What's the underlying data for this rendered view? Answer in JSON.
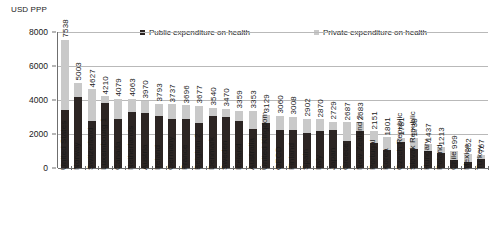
{
  "chart_data": {
    "type": "bar",
    "subtype": "stacked-column",
    "title": "",
    "xlabel": "",
    "ylabel": "USD PPP",
    "ylim": [
      0,
      8000
    ],
    "yticks": [
      0,
      2000,
      4000,
      6000,
      8000
    ],
    "grid": true,
    "legend_position": "top-center",
    "categories": [
      "United States",
      "Norway",
      "Switzerland",
      "Luxembourg 1",
      "Canada",
      "Netherlands",
      "Austria",
      "Ireland",
      "Germany",
      "France",
      "Belgium 2",
      "Denmark",
      "Sweden",
      "Iceland",
      "Australia",
      "United Kingdom",
      "OECD",
      "Finland",
      "Spain",
      "Italy",
      "Japan",
      "Greece",
      "New Zealand 2",
      "Portugal",
      "Korea",
      "Czech Republic",
      "Slovak Republic",
      "Hungary",
      "Poland",
      "Chile",
      "Mexico",
      "Turkey"
    ],
    "totals": [
      7538,
      5003,
      4627,
      4210,
      4079,
      4063,
      3970,
      3793,
      3737,
      3696,
      3677,
      3540,
      3470,
      3359,
      3353,
      3129,
      3060,
      3008,
      2902,
      2870,
      2729,
      2687,
      2683,
      2151,
      1801,
      1781,
      1738,
      1437,
      1213,
      999,
      852,
      767
    ],
    "series": [
      {
        "name": "Public expenditure on health",
        "color": "#2c2523",
        "values": [
          3426,
          4205,
          2750,
          3839,
          2885,
          3296,
          3209,
          3063,
          2876,
          2872,
          2659,
          3033,
          2994,
          2752,
          2278,
          2626,
          2256,
          2252,
          2043,
          2206,
          2230,
          1613,
          2177,
          1444,
          1060,
          1522,
          1142,
          1014,
          858,
          470,
          350,
          545
        ]
      },
      {
        "name": "Private expenditure on health",
        "color": "#c9c9c9",
        "values": [
          4112,
          798,
          1877,
          371,
          1194,
          767,
          761,
          730,
          861,
          824,
          1018,
          507,
          476,
          607,
          1075,
          503,
          804,
          756,
          859,
          664,
          499,
          1074,
          506,
          707,
          741,
          259,
          596,
          423,
          355,
          529,
          502,
          222
        ]
      }
    ]
  }
}
